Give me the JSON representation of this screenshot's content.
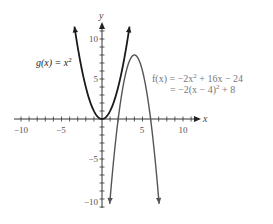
{
  "chart_data": {
    "type": "line",
    "title": "",
    "xlabel": "x",
    "ylabel": "y",
    "xlim": [
      -10.5,
      12
    ],
    "ylim": [
      -11.5,
      12
    ],
    "grid": false,
    "x_ticks": [
      -10,
      -5,
      5,
      10
    ],
    "y_ticks": [
      10,
      5,
      -5,
      -10
    ],
    "x_tick_labels": [
      "−10",
      "−5",
      "5",
      "10"
    ],
    "y_tick_labels": [
      "10",
      "5",
      "−5",
      "−10"
    ],
    "series": [
      {
        "name": "g(x) = x²",
        "expression": "x^2",
        "x_range": [
          -3.4,
          3.4
        ],
        "points": [
          [
            -3.4,
            11.56
          ],
          [
            -3,
            9
          ],
          [
            -2,
            4
          ],
          [
            -1,
            1
          ],
          [
            0,
            0
          ],
          [
            1,
            1
          ],
          [
            2,
            4
          ],
          [
            3,
            9
          ],
          [
            3.4,
            11.56
          ]
        ],
        "color": "#1a1a1a"
      },
      {
        "name": "f(x) = −2x² + 16x − 24 = −2(x − 4)² + 8",
        "expression": "-2(x-4)^2+8",
        "x_range": [
          0.95,
          7.05
        ],
        "vertex": [
          4,
          8
        ],
        "roots": [
          2,
          6
        ],
        "points": [
          [
            1,
            -10
          ],
          [
            2,
            0
          ],
          [
            3,
            6
          ],
          [
            4,
            8
          ],
          [
            5,
            6
          ],
          [
            6,
            0
          ],
          [
            7,
            -10
          ]
        ],
        "color": "#555555"
      }
    ],
    "annotations": [
      {
        "text": "g(x) = x²",
        "near": [
          -5,
          7
        ]
      },
      {
        "text": "f(x) = −2x² + 16x − 24",
        "near": [
          7,
          4
        ]
      },
      {
        "text": "= −2(x − 4)² + 8",
        "near": [
          8,
          2
        ]
      }
    ]
  },
  "labels": {
    "x_axis": "x",
    "y_axis": "y",
    "g_label_main": "g(x) = x",
    "g_label_exp": "2",
    "f_line1_a": "f(x) = −2x",
    "f_line1_exp": "2",
    "f_line1_b": " + 16x − 24",
    "f_line2_a": "= −2(x − 4)",
    "f_line2_exp": "2",
    "f_line2_b": " + 8"
  }
}
